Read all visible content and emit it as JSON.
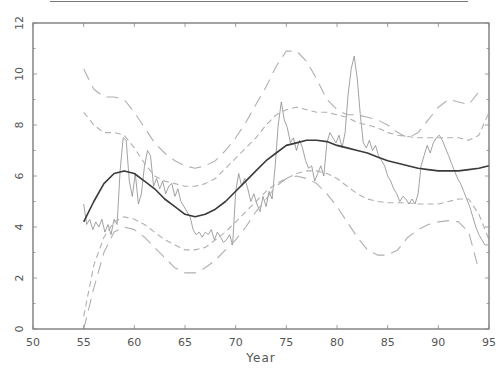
{
  "chart_data": {
    "type": "line",
    "title": "",
    "xlabel": "Year",
    "ylabel": "",
    "xlim": [
      50,
      95
    ],
    "ylim": [
      0,
      12
    ],
    "x_ticks": [
      50,
      55,
      60,
      65,
      70,
      75,
      80,
      85,
      90,
      95
    ],
    "y_ticks": [
      0,
      2,
      4,
      6,
      8,
      10,
      12
    ],
    "grid": false,
    "legend": null,
    "series": [
      {
        "name": "observed",
        "style": "thin-solid",
        "color": "#888888",
        "x": [
          55.0,
          55.3,
          55.6,
          55.9,
          56.2,
          56.5,
          56.8,
          57.1,
          57.4,
          57.7,
          58.0,
          58.3,
          58.6,
          58.9,
          59.2,
          59.5,
          59.8,
          60.1,
          60.4,
          60.7,
          61.0,
          61.3,
          61.6,
          61.9,
          62.2,
          62.5,
          62.8,
          63.1,
          63.4,
          63.7,
          64.0,
          64.3,
          64.6,
          64.9,
          65.2,
          65.5,
          65.8,
          66.1,
          66.4,
          66.7,
          67.0,
          67.3,
          67.6,
          67.9,
          68.2,
          68.5,
          68.8,
          69.1,
          69.4,
          69.7,
          70.0,
          70.3,
          70.6,
          70.9,
          71.2,
          71.5,
          71.8,
          72.1,
          72.4,
          72.7,
          73.0,
          73.3,
          73.6,
          73.9,
          74.2,
          74.5,
          74.8,
          75.1,
          75.4,
          75.7,
          76.0,
          76.3,
          76.6,
          76.9,
          77.2,
          77.5,
          77.8,
          78.1,
          78.4,
          78.7,
          79.0,
          79.3,
          79.6,
          79.9,
          80.2,
          80.5,
          80.8,
          81.1,
          81.4,
          81.7,
          82.0,
          82.3,
          82.6,
          82.9,
          83.2,
          83.5,
          83.8,
          84.1,
          84.4,
          84.7,
          85.0,
          85.3,
          85.6,
          85.9,
          86.2,
          86.5,
          86.8,
          87.1,
          87.4,
          87.7,
          88.0,
          88.3,
          88.6,
          88.9,
          89.2,
          89.5,
          89.8,
          90.1,
          90.4,
          90.7,
          91.0,
          91.3,
          91.6,
          91.9,
          92.2,
          92.5,
          92.8,
          93.1,
          93.4,
          93.7,
          94.0,
          94.3,
          94.6,
          94.9
        ],
        "values": [
          4.9,
          4.1,
          4.3,
          3.9,
          4.2,
          4.0,
          4.3,
          3.8,
          4.1,
          3.7,
          4.3,
          4.1,
          6.2,
          7.5,
          7.4,
          5.8,
          5.2,
          6.1,
          4.9,
          5.3,
          6.4,
          7.0,
          6.8,
          5.6,
          5.9,
          5.5,
          5.8,
          5.3,
          5.6,
          5.7,
          5.2,
          5.5,
          5.0,
          4.8,
          4.6,
          4.4,
          3.9,
          3.7,
          3.8,
          3.6,
          3.8,
          3.7,
          3.9,
          3.5,
          3.8,
          3.6,
          3.4,
          3.5,
          3.7,
          3.3,
          5.4,
          6.1,
          5.6,
          5.9,
          5.5,
          5.0,
          5.3,
          4.9,
          4.6,
          5.2,
          4.8,
          5.4,
          5.1,
          6.4,
          8.0,
          8.9,
          8.2,
          7.9,
          7.3,
          7.5,
          7.0,
          7.4,
          7.1,
          6.6,
          6.3,
          6.4,
          5.8,
          6.1,
          6.4,
          6.0,
          7.3,
          7.7,
          7.5,
          7.3,
          7.6,
          7.1,
          7.7,
          9.2,
          10.2,
          10.7,
          9.8,
          8.4,
          7.3,
          7.1,
          7.4,
          7.0,
          7.2,
          6.8,
          6.6,
          6.4,
          6.0,
          5.8,
          5.5,
          5.3,
          5.0,
          5.2,
          5.1,
          4.9,
          5.1,
          4.9,
          5.3,
          6.4,
          6.8,
          7.2,
          6.9,
          7.3,
          7.5,
          7.6,
          7.4,
          7.1,
          6.8,
          6.5,
          6.2,
          5.9,
          5.7,
          5.4,
          5.1,
          4.8,
          4.4,
          4.0,
          3.7,
          3.5,
          3.3,
          3.3
        ]
      },
      {
        "name": "smooth-fit",
        "style": "thick-solid",
        "color": "#333333",
        "x": [
          55,
          56,
          57,
          58,
          59,
          60,
          61,
          62,
          63,
          64,
          65,
          66,
          67,
          68,
          69,
          70,
          71,
          72,
          73,
          74,
          75,
          76,
          77,
          78,
          79,
          80,
          81,
          82,
          83,
          84,
          85,
          86,
          87,
          88,
          89,
          90,
          91,
          92,
          93,
          94,
          95
        ],
        "values": [
          4.2,
          5.0,
          5.7,
          6.1,
          6.2,
          6.1,
          5.8,
          5.5,
          5.1,
          4.8,
          4.5,
          4.4,
          4.5,
          4.7,
          5.0,
          5.4,
          5.8,
          6.2,
          6.6,
          6.9,
          7.2,
          7.3,
          7.4,
          7.4,
          7.35,
          7.2,
          7.1,
          7.0,
          6.9,
          6.75,
          6.6,
          6.5,
          6.4,
          6.3,
          6.25,
          6.2,
          6.2,
          6.2,
          6.25,
          6.3,
          6.4
        ]
      },
      {
        "name": "upper-outer-band",
        "style": "long-dash",
        "color": "#aaaaaa",
        "x": [
          55,
          56,
          57,
          58,
          59,
          60,
          61,
          62,
          63,
          64,
          65,
          66,
          67,
          68,
          69,
          70,
          71,
          72,
          73,
          74,
          75,
          76,
          77,
          78,
          79,
          80,
          81,
          82,
          83,
          84,
          85,
          86,
          87,
          88,
          89,
          90,
          91,
          92,
          93,
          94,
          95
        ],
        "values": [
          10.2,
          9.4,
          9.1,
          9.1,
          9.0,
          8.5,
          7.9,
          7.3,
          6.9,
          6.6,
          6.4,
          6.3,
          6.4,
          6.6,
          7.0,
          7.5,
          8.1,
          8.8,
          9.5,
          10.3,
          10.9,
          10.9,
          10.5,
          9.8,
          9.0,
          8.6,
          8.4,
          8.4,
          8.3,
          8.2,
          8.0,
          7.7,
          7.5,
          7.7,
          8.2,
          8.7,
          9.0,
          8.9,
          8.8,
          9.3,
          null
        ]
      },
      {
        "name": "upper-inner-band",
        "style": "short-dash",
        "color": "#aaaaaa",
        "x": [
          55,
          56,
          57,
          58,
          59,
          60,
          61,
          62,
          63,
          64,
          65,
          66,
          67,
          68,
          69,
          70,
          71,
          72,
          73,
          74,
          75,
          76,
          77,
          78,
          79,
          80,
          81,
          82,
          83,
          84,
          85,
          86,
          87,
          88,
          89,
          90,
          91,
          92,
          93,
          94,
          95
        ],
        "values": [
          8.5,
          8.0,
          7.7,
          7.7,
          7.6,
          7.1,
          6.5,
          6.0,
          5.8,
          5.7,
          5.6,
          5.6,
          5.7,
          5.9,
          6.3,
          6.7,
          7.1,
          7.5,
          8.0,
          8.4,
          8.6,
          8.7,
          8.6,
          8.5,
          8.5,
          8.4,
          8.3,
          8.1,
          8.0,
          7.9,
          7.7,
          7.6,
          7.55,
          7.5,
          7.5,
          7.5,
          7.5,
          7.5,
          7.4,
          7.6,
          8.5
        ]
      },
      {
        "name": "lower-inner-band",
        "style": "short-dash",
        "color": "#aaaaaa",
        "x": [
          55,
          56,
          57,
          58,
          59,
          60,
          61,
          62,
          63,
          64,
          65,
          66,
          67,
          68,
          69,
          70,
          71,
          72,
          73,
          74,
          75,
          76,
          77,
          78,
          79,
          80,
          81,
          82,
          83,
          84,
          85,
          86,
          87,
          88,
          89,
          90,
          91,
          92,
          93,
          94,
          95
        ],
        "values": [
          0.5,
          2.5,
          3.6,
          4.2,
          4.4,
          4.3,
          4.1,
          3.8,
          3.5,
          3.3,
          3.1,
          3.1,
          3.2,
          3.5,
          3.8,
          4.2,
          4.6,
          5.0,
          5.4,
          5.7,
          5.9,
          6.1,
          6.2,
          6.2,
          6.1,
          5.9,
          5.6,
          5.3,
          5.1,
          5.0,
          4.95,
          4.95,
          4.95,
          4.9,
          4.9,
          4.9,
          5.0,
          5.1,
          5.1,
          4.5,
          3.5
        ]
      },
      {
        "name": "lower-outer-band",
        "style": "long-dash",
        "color": "#aaaaaa",
        "x": [
          55,
          56,
          57,
          58,
          59,
          60,
          61,
          62,
          63,
          64,
          65,
          66,
          67,
          68,
          69,
          70,
          71,
          72,
          73,
          74,
          75,
          76,
          77,
          78,
          79,
          80,
          81,
          82,
          83,
          84,
          85,
          86,
          87,
          88,
          89,
          90,
          91,
          92,
          93,
          94,
          95
        ],
        "values": [
          0.0,
          1.6,
          3.0,
          3.8,
          4.0,
          3.9,
          3.6,
          3.2,
          2.8,
          2.4,
          2.2,
          2.2,
          2.4,
          2.7,
          3.1,
          3.5,
          4.0,
          4.6,
          5.1,
          5.6,
          5.9,
          6.0,
          5.9,
          5.7,
          5.3,
          4.8,
          4.2,
          3.6,
          3.1,
          2.9,
          2.9,
          3.1,
          3.6,
          3.9,
          4.1,
          4.2,
          4.25,
          4.2,
          3.8,
          2.3,
          null
        ]
      }
    ]
  },
  "header": {
    "top_rule": true
  },
  "axes": {
    "x_title": "Year",
    "x_tick_labels": [
      "50",
      "55",
      "60",
      "65",
      "70",
      "75",
      "80",
      "85",
      "90",
      "95"
    ],
    "y_tick_labels": [
      "0",
      "2",
      "4",
      "6",
      "8",
      "10",
      "12"
    ]
  }
}
